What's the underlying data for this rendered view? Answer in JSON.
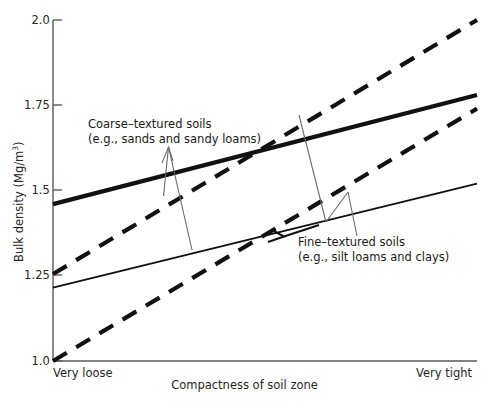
{
  "chart_data": {
    "type": "line",
    "title": "",
    "subtitle": "",
    "xlabel": "Compactness of soil zone",
    "ylabel": "Bulk density (Mg/m3)",
    "ylabel_display": "Bulk density (Mg/m",
    "ylabel_exponent": "3",
    "ylabel_close": ")",
    "grid": false,
    "legend": "none (inline annotations)",
    "ylim": [
      1.0,
      2.0
    ],
    "yticks": [
      "1.0",
      "1.25",
      "1.5",
      "1.75",
      "2.0"
    ],
    "ytick_values": [
      1.0,
      1.25,
      1.5,
      1.75,
      2.0
    ],
    "xlim_labels": [
      "Very loose",
      "Very tight"
    ],
    "x": [
      0,
      1
    ],
    "series": [
      {
        "name": "Coarse-textured soils (upper bound)",
        "group": "Coarse-textured soils",
        "style": "solid-thick",
        "values": [
          1.46,
          1.78
        ]
      },
      {
        "name": "Coarse-textured soils (lower bound)",
        "group": "Coarse-textured soils",
        "style": "solid-thin",
        "values": [
          1.215,
          1.52
        ]
      },
      {
        "name": "Fine-textured soils (upper bound)",
        "group": "Fine-textured soils",
        "style": "dashed",
        "values": [
          1.255,
          2.0
        ]
      },
      {
        "name": "Fine-textured soils (lower bound)",
        "group": "Fine-textured soils",
        "style": "dashed",
        "values": [
          1.0,
          1.74
        ]
      }
    ],
    "annotations": [
      {
        "id": "coarse",
        "line1": "Coarse–textured soils",
        "line2": "(e.g., sands and sandy loams)",
        "target": "solid lines"
      },
      {
        "id": "fine",
        "line1": "Fine–textured soils",
        "line2": "(e.g., silt loams and clays)",
        "target": "dashed lines"
      }
    ]
  },
  "axes": {
    "y_ticks": [
      {
        "label": "2.0"
      },
      {
        "label": "1.75"
      },
      {
        "label": "1.5"
      },
      {
        "label": "1.25"
      },
      {
        "label": "1.0"
      }
    ],
    "x_start_label": "Very loose",
    "x_end_label": "Very tight",
    "x_title": "Compactness of soil zone",
    "y_title_main": "Bulk density (Mg/m",
    "y_title_sup": "3",
    "y_title_tail": ")"
  },
  "annotations": {
    "coarse": {
      "line1": "Coarse–textured soils",
      "line2": "(e.g., sands and sandy loams)"
    },
    "fine": {
      "line1": "Fine–textured soils",
      "line2": "(e.g., silt loams and clays)"
    }
  },
  "colors": {
    "background": "#ffffff",
    "ink": "#1a1a1a",
    "axis": "#555555",
    "text": "#262626",
    "leader": "#6b6b6b"
  }
}
